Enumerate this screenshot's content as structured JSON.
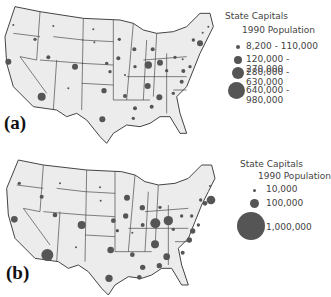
{
  "panels": [
    {
      "label": "(a)",
      "legend": {
        "title": "State Capitals",
        "subtitle": "1990 Population",
        "classes": [
          {
            "label": "8,200 - 110,000",
            "size": 4
          },
          {
            "label": "120,000 - 270,000",
            "size": 8
          },
          {
            "label": "280,000 - 630,000",
            "size": 12
          },
          {
            "label": "640,000 - 980,000",
            "size": 17
          }
        ]
      }
    },
    {
      "label": "(b)",
      "legend": {
        "title": "State Capitals",
        "subtitle": "1990 Population",
        "classes": [
          {
            "label": "10,000",
            "size": 3
          },
          {
            "label": "100,000",
            "size": 9
          },
          {
            "label": "1,000,000",
            "size": 28
          }
        ]
      }
    }
  ],
  "colors": {
    "land": "#ececec",
    "border": "#444444",
    "symbol": "#555555"
  }
}
